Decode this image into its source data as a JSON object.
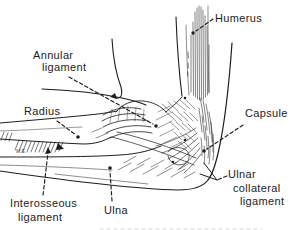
{
  "figure": {
    "background": "#ffffff",
    "ink_color": "#1d1d1d",
    "labels": {
      "humerus": "Humerus",
      "annular_ligament": [
        "Annular",
        "ligament"
      ],
      "radius": "Radius",
      "capsule": "Capsule",
      "ulnar_collateral_ligament": [
        "Ulnar",
        "collateral",
        "ligament"
      ],
      "interosseous_ligament": [
        "Interosseous",
        "ligament"
      ],
      "ulna": "Ulna",
      "artist_initials": "M.E."
    }
  }
}
